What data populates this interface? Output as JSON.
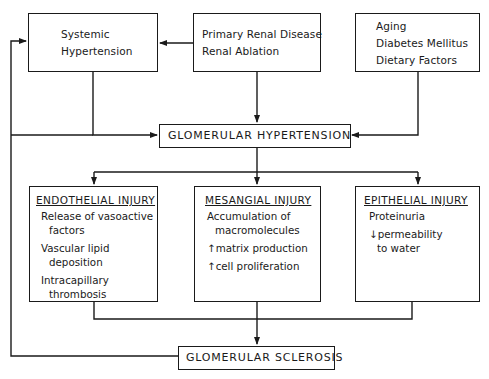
{
  "diagram": {
    "top_nodes": {
      "systemic": {
        "lines": [
          "Systemic",
          "Hypertension"
        ]
      },
      "primary": {
        "lines": [
          "Primary Renal Disease",
          "Renal Ablation"
        ]
      },
      "aging": {
        "lines": [
          "Aging",
          "Diabetes Mellitus",
          "Dietary Factors"
        ]
      }
    },
    "glomerular_hypertension": {
      "label": "GLOMERULAR HYPERTENSION"
    },
    "injuries": {
      "endothelial": {
        "title": "ENDOTHELIAL INJURY",
        "items": [
          {
            "l1": "Release of vasoactive",
            "l2": "factors"
          },
          {
            "l1": "Vascular lipid",
            "l2": "deposition"
          },
          {
            "l1": "Intracapillary",
            "l2": "thrombosis"
          }
        ]
      },
      "mesangial": {
        "title": "MESANGIAL INJURY",
        "items": [
          {
            "l1": "Accumulation of",
            "l2": "macromolecules"
          },
          {
            "l1": "↑matrix production",
            "l2": ""
          },
          {
            "l1": "↑cell proliferation",
            "l2": ""
          }
        ]
      },
      "epithelial": {
        "title": "EPITHELIAL INJURY",
        "items": [
          {
            "l1": "Proteinuria",
            "l2": ""
          },
          {
            "l1": "↓permeability",
            "l2": "to water"
          }
        ]
      }
    },
    "glomerular_sclerosis": {
      "label": "GLOMERULAR SCLEROSIS"
    },
    "colors": {
      "ink": "#1a1a1a",
      "background": "#ffffff"
    }
  }
}
